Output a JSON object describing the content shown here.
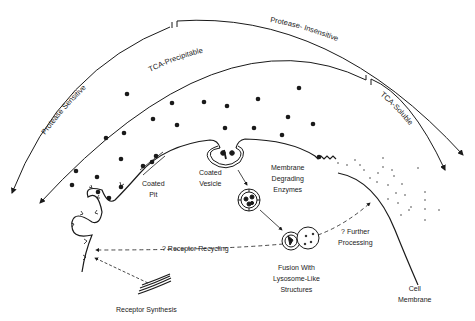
{
  "diagram": {
    "type": "cell receptor-mediated endocytosis schematic",
    "colors": {
      "ink": "#1a1a1a",
      "background": "#ffffff"
    },
    "arc_labels": {
      "protease_sensitive": "Protease Sensitive",
      "protease_insensitive": "Protease- Insensitive",
      "tca_precipitable": "TCA-Precipitable",
      "tca_soluble": "TCA-Soluble"
    },
    "labels": {
      "coated_pit": [
        "Coated",
        "Pit"
      ],
      "coated_vesicle": [
        "Coated",
        "Vesicle"
      ],
      "membrane_degrading_enzymes": [
        "Membrane",
        "Degrading",
        "Enzymes"
      ],
      "fusion": [
        "Fusion With",
        "Lysosome-Like",
        "Structures"
      ],
      "further_processing": [
        "? Further",
        "Processing"
      ],
      "receptor_recycling": "? Receptor Recycling",
      "receptor_synthesis": "Receptor Synthesis",
      "cell_membrane": [
        "Cell",
        "Membrane"
      ]
    }
  }
}
